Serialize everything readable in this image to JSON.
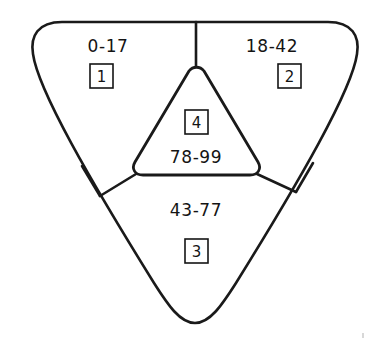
{
  "diagram": {
    "background_color": "#ffffff",
    "line_color": "#1a1a1a",
    "text_color": "#141414",
    "regions": [
      {
        "id": "region-top-left",
        "range_label": "0-17",
        "badge_label": "1",
        "position": "top-left-lobe"
      },
      {
        "id": "region-top-right",
        "range_label": "18-42",
        "badge_label": "2",
        "position": "top-right-lobe"
      },
      {
        "id": "region-bottom",
        "range_label": "43-77",
        "badge_label": "3",
        "position": "bottom-lobe"
      },
      {
        "id": "region-center",
        "range_label": "78-99",
        "badge_label": "4",
        "position": "center-triangle"
      }
    ]
  }
}
